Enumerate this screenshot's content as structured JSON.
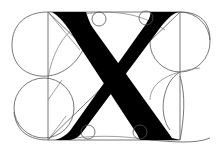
{
  "diagram": {
    "title": "Geometric construction of the capital letter X",
    "letter": "X",
    "colors": {
      "glyph": "#000000",
      "guides": "#555555",
      "background": "#ffffff"
    },
    "elements": {
      "frame": "square construction frame",
      "thick_stroke": "thick diagonal stroke (top-left to bottom-right)",
      "thin_stroke": "thin diagonal stroke (top-right to bottom-left)",
      "serif_circles": "four small serif circles",
      "guide_circles": "large construction circles",
      "diagonals": "construction diagonals"
    }
  }
}
